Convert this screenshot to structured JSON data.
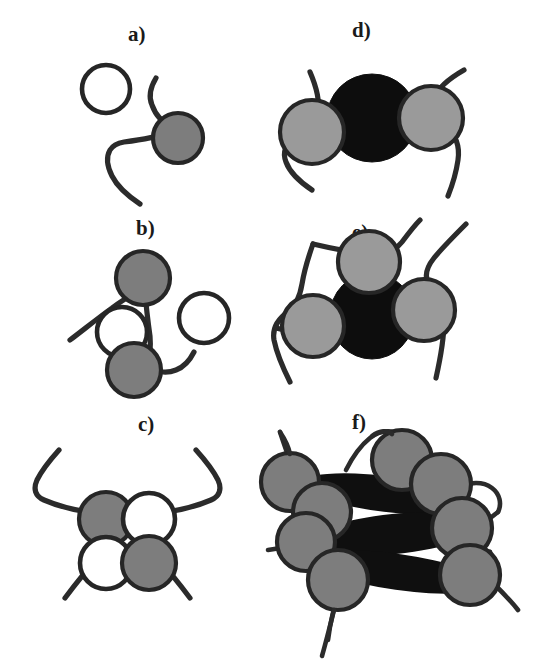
{
  "figure": {
    "background_color": "#ffffff",
    "width": 537,
    "height": 670,
    "colors": {
      "chain_stroke": "#2b2b2b",
      "bead_gray_fill": "#7d7d7d",
      "bead_gray_light_fill": "#9a9a9a",
      "bead_outline": "#262626",
      "bead_white_fill": "#ffffff",
      "blob_black_fill": "#0f0f0f",
      "label_color": "#1a1a1a"
    }
  },
  "panels": [
    {
      "id": "a",
      "label": "a)",
      "label_x": 128,
      "label_y": 24,
      "description": "One empty circle and one filled gray bead attached to a single polymer chain",
      "gray_beads": 1,
      "white_beads": 1,
      "black_blobs": 0,
      "chains": 1
    },
    {
      "id": "b",
      "label": "b)",
      "label_x": 136,
      "label_y": 218,
      "description": "Two gray beads on a chain with an empty circle between them and a free empty circle at right",
      "gray_beads": 2,
      "white_beads": 2,
      "black_blobs": 0,
      "chains": 1
    },
    {
      "id": "c",
      "label": "c)",
      "label_x": 138,
      "label_y": 414,
      "description": "Four circles in a two by two checkerboard of gray and empty beads with chains entering from both sides",
      "gray_beads": 2,
      "white_beads": 2,
      "black_blobs": 0,
      "chains": 2
    },
    {
      "id": "d",
      "label": "d)",
      "label_x": 352,
      "label_y": 20,
      "description": "Two gray beads flanking one large black aggregate, each bead threaded by a chain",
      "gray_beads": 2,
      "white_beads": 0,
      "black_blobs": 1,
      "chains": 2
    },
    {
      "id": "e",
      "label": "e)",
      "label_x": 352,
      "label_y": 222,
      "description": "Three gray beads arranged around a central black aggregate with chains looping around",
      "gray_beads": 3,
      "white_beads": 0,
      "black_blobs": 1,
      "chains": 2
    },
    {
      "id": "f",
      "label": "f)",
      "label_x": 352,
      "label_y": 412,
      "description": "Large stacked aggregate of elongated black lamellae surrounded by nine gray beads connected by chains",
      "gray_beads": 9,
      "white_beads": 0,
      "black_blobs": 3,
      "chains": 4
    }
  ]
}
